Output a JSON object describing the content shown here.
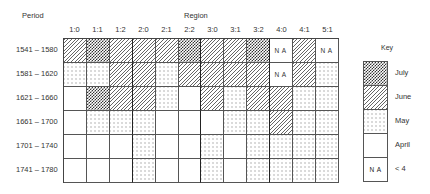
{
  "chart_data": {
    "type": "heatmap",
    "title": "",
    "xlabel": "Region",
    "ylabel": "Period",
    "columns": [
      "1:0",
      "1:1",
      "1:2",
      "2:0",
      "2:1",
      "2:2",
      "3:0",
      "3:1",
      "3:2",
      "4:0",
      "4:1",
      "5:1"
    ],
    "rows": [
      "1541 – 1580",
      "1581 – 1620",
      "1621 – 1660",
      "1661 – 1700",
      "1701 – 1740",
      "1741 – 1780"
    ],
    "values": [
      [
        "June",
        "July",
        "June",
        "June",
        "June",
        "July",
        "June",
        "June",
        "July",
        "NA",
        "June",
        "NA"
      ],
      [
        "May",
        "May",
        "June",
        "June",
        "May",
        "June",
        "June",
        "June",
        "June",
        "NA",
        "June",
        "May"
      ],
      [
        "April",
        "July",
        "June",
        "June",
        "May",
        "April",
        "June",
        "May",
        "June",
        "June",
        "May",
        "May"
      ],
      [
        "April",
        "May",
        "May",
        "May",
        "April",
        "April",
        "April",
        "May",
        "May",
        "June",
        "May",
        "May"
      ],
      [
        "April",
        "April",
        "April",
        "May",
        "April",
        "April",
        "May",
        "April",
        "May",
        "May",
        "May",
        "May"
      ],
      [
        "April",
        "April",
        "April",
        "May",
        "April",
        "April",
        "May",
        "April",
        "May",
        "May",
        "May",
        "May"
      ]
    ],
    "legend": {
      "title": "Key",
      "position": "right",
      "entries": [
        {
          "code": "J",
          "label": "July",
          "pattern": "cross-hatch dark"
        },
        {
          "code": "U",
          "label": "June",
          "pattern": "diagonal lines"
        },
        {
          "code": "M",
          "label": "May",
          "pattern": "dots"
        },
        {
          "code": "A",
          "label": "April",
          "pattern": "blank"
        },
        {
          "code": "N",
          "label": "< 4",
          "pattern": "text NA"
        }
      ]
    },
    "thick_dividers_after": [
      "1:2",
      "2:2",
      "3:2"
    ],
    "grid": true
  },
  "labels": {
    "period": "Period",
    "region": "Region",
    "key": "Key",
    "na_text": "N A"
  }
}
